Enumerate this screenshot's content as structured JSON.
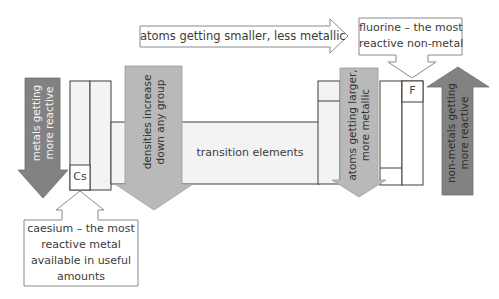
{
  "diagram": {
    "colors": {
      "cell_fill": "#f3f3f3",
      "cell_stroke": "#3f3f3f",
      "light_arrow": "#b9b9b9",
      "dark_arrow": "#828282",
      "callout_stroke": "#8a8a8a",
      "text": "#3b3b3b"
    },
    "top_arrow": {
      "label": "atoms getting smaller, less metallic",
      "direction": "right"
    },
    "fluorine_callout": {
      "line1": "fluorine – the most",
      "line2": "reactive non-metal",
      "points_to": "F"
    },
    "caesium_callout": {
      "line1": "caesium – the most",
      "line2": "reactive metal",
      "line3": "available in useful",
      "line4": "amounts",
      "points_to": "Cs"
    },
    "left_dark_arrow": {
      "line1": "metals getting",
      "line2": "more reactive",
      "direction": "down"
    },
    "density_arrow": {
      "line1": "densities increase",
      "line2": "down any group",
      "direction": "down"
    },
    "transition_block": {
      "label": "transition elements"
    },
    "right_light_arrow": {
      "line1": "atoms getting larger,",
      "line2": "more metallic",
      "direction": "down"
    },
    "right_dark_arrow": {
      "line1": "non-metals getting",
      "line2": "more reactive",
      "direction": "up"
    },
    "elements": {
      "cs": "Cs",
      "f": "F"
    }
  }
}
